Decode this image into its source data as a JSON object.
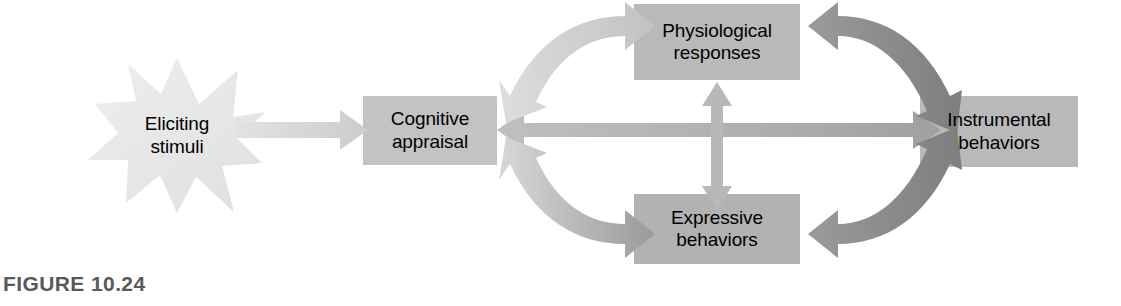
{
  "figure": {
    "caption": "FIGURE 10.24",
    "caption_color": "#58595b",
    "background": "#ffffff"
  },
  "nodes": [
    {
      "id": "eliciting-stimuli",
      "shape": "starburst",
      "line1": "Eliciting",
      "line2": "stimuli",
      "fill": "#e6e6e6"
    },
    {
      "id": "cognitive-appraisal",
      "shape": "rect",
      "line1": "Cognitive",
      "line2": "appraisal",
      "fill": "#c3c3c3"
    },
    {
      "id": "physiological-responses",
      "shape": "rect",
      "line1": "Physiological",
      "line2": "responses",
      "fill": "#b9b9b9"
    },
    {
      "id": "expressive-behaviors",
      "shape": "rect",
      "line1": "Expressive",
      "line2": "behaviors",
      "fill": "#b2b2b2"
    },
    {
      "id": "instrumental-behaviors",
      "shape": "rect",
      "line1": "Instrumental",
      "line2": "behaviors",
      "fill": "#b9b9b9"
    }
  ],
  "connectors": [
    {
      "id": "stimuli-to-appraisal",
      "from": "eliciting-stimuli",
      "to": "cognitive-appraisal",
      "heads": "single",
      "color": "#d2d2d2",
      "style": "straight-horizontal"
    },
    {
      "id": "appraisal-to-physiological",
      "from": "cognitive-appraisal",
      "to": "physiological-responses",
      "heads": "double",
      "color": "#d0d0d0",
      "style": "curved-arc-up"
    },
    {
      "id": "appraisal-to-expressive",
      "from": "cognitive-appraisal",
      "to": "expressive-behaviors",
      "heads": "double",
      "color": "#b4b4b4",
      "style": "curved-arc-down"
    },
    {
      "id": "appraisal-to-instrumental",
      "from": "cognitive-appraisal",
      "to": "instrumental-behaviors",
      "heads": "double",
      "color": "#b0b0b0",
      "style": "straight-horizontal"
    },
    {
      "id": "physiological-to-expressive",
      "from": "physiological-responses",
      "to": "expressive-behaviors",
      "heads": "double",
      "color": "#b8b8b8",
      "style": "straight-vertical"
    },
    {
      "id": "physiological-to-instrumental",
      "from": "physiological-responses",
      "to": "instrumental-behaviors",
      "heads": "double",
      "color": "#8d8d8d",
      "style": "curved-arc-right-up"
    },
    {
      "id": "expressive-to-instrumental",
      "from": "expressive-behaviors",
      "to": "instrumental-behaviors",
      "heads": "double",
      "color": "#8d8d8d",
      "style": "curved-arc-right-down"
    }
  ]
}
